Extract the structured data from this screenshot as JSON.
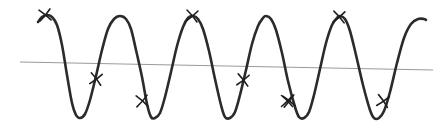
{
  "figure": {
    "background_color": "#ffffff",
    "width": 443,
    "height": 131
  },
  "chart_data": {
    "type": "line",
    "title": "",
    "subtitle": "",
    "xlabel": "",
    "ylabel": "",
    "xlim": [
      0,
      443
    ],
    "ylim": [
      131,
      0
    ],
    "grid": false,
    "legend": null,
    "axis_ticks": {
      "x": [],
      "y": []
    },
    "series": [
      {
        "name": "waveform",
        "kind": "line",
        "color": "#2b2b2b",
        "stroke_width": 2.6,
        "description": "Quasi-sinusoidal oscillation, 5 full peaks, flat-ish rounded crests and troughs, period about 73 px",
        "period_px": 73,
        "peak_y": 16,
        "trough_y": 118,
        "peaks_x": [
          47,
          120,
          193,
          265,
          339
        ],
        "troughs_x": [
          78,
          150,
          226,
          300,
          375
        ],
        "start_point": [
          38,
          22
        ],
        "end_point": [
          426,
          20
        ],
        "points": [
          [
            38,
            22
          ],
          [
            42,
            17
          ],
          [
            47,
            15
          ],
          [
            52,
            17
          ],
          [
            57,
            25
          ],
          [
            62,
            45
          ],
          [
            67,
            75
          ],
          [
            72,
            103
          ],
          [
            76,
            115
          ],
          [
            80,
            118
          ],
          [
            85,
            114
          ],
          [
            90,
            100
          ],
          [
            96,
            76
          ],
          [
            102,
            50
          ],
          [
            108,
            29
          ],
          [
            114,
            19
          ],
          [
            120,
            16
          ],
          [
            126,
            19
          ],
          [
            131,
            29
          ],
          [
            136,
            50
          ],
          [
            142,
            77
          ],
          [
            147,
            104
          ],
          [
            151,
            117
          ],
          [
            155,
            118
          ],
          [
            160,
            113
          ],
          [
            165,
            97
          ],
          [
            171,
            72
          ],
          [
            177,
            46
          ],
          [
            183,
            27
          ],
          [
            188,
            18
          ],
          [
            193,
            16
          ],
          [
            198,
            19
          ],
          [
            203,
            29
          ],
          [
            209,
            51
          ],
          [
            215,
            79
          ],
          [
            221,
            105
          ],
          [
            225,
            117
          ],
          [
            230,
            118
          ],
          [
            235,
            112
          ],
          [
            240,
            95
          ],
          [
            246,
            70
          ],
          [
            252,
            44
          ],
          [
            258,
            26
          ],
          [
            263,
            18
          ],
          [
            266,
            16
          ],
          [
            271,
            19
          ],
          [
            276,
            30
          ],
          [
            282,
            53
          ],
          [
            288,
            81
          ],
          [
            295,
            107
          ],
          [
            299,
            117
          ],
          [
            304,
            118
          ],
          [
            309,
            112
          ],
          [
            314,
            95
          ],
          [
            320,
            69
          ],
          [
            326,
            43
          ],
          [
            332,
            25
          ],
          [
            337,
            18
          ],
          [
            340,
            16
          ],
          [
            345,
            19
          ],
          [
            350,
            31
          ],
          [
            356,
            55
          ],
          [
            363,
            85
          ],
          [
            370,
            110
          ],
          [
            374,
            118
          ],
          [
            379,
            118
          ],
          [
            384,
            111
          ],
          [
            390,
            92
          ],
          [
            397,
            63
          ],
          [
            404,
            38
          ],
          [
            411,
            24
          ],
          [
            418,
            19
          ],
          [
            424,
            19
          ],
          [
            426,
            20
          ]
        ]
      },
      {
        "name": "baseline",
        "kind": "line",
        "color": "#9a9a9a",
        "stroke_width": 1.1,
        "description": "Thin gray near-horizontal reference line sloping slightly downward",
        "points": [
          [
            20,
            62
          ],
          [
            433,
            70
          ]
        ]
      }
    ],
    "annotations": {
      "marker_symbol": "x",
      "marker_color": "#1f1f1f",
      "marker_stroke_width": 1.6,
      "marker_size": 11,
      "count": 9,
      "points": [
        {
          "label": "m1",
          "x": 45,
          "y": 15,
          "location": "peak-1",
          "rotation": -6
        },
        {
          "label": "m2",
          "x": 96,
          "y": 79,
          "location": "rising-edge-1",
          "rotation": 8
        },
        {
          "label": "m3",
          "x": 142,
          "y": 101,
          "location": "falling-edge-2",
          "rotation": -4
        },
        {
          "label": "m4",
          "x": 192,
          "y": 16,
          "location": "peak-3",
          "rotation": 5
        },
        {
          "label": "m5",
          "x": 243,
          "y": 80,
          "location": "rising-edge-3",
          "rotation": 7
        },
        {
          "label": "m6",
          "x": 289,
          "y": 101,
          "location": "falling-edge-4",
          "rotation": -7
        },
        {
          "label": "m7",
          "x": 339,
          "y": 17,
          "location": "peak-5",
          "rotation": 4
        },
        {
          "label": "m8",
          "x": 383,
          "y": 101,
          "location": "falling-edge-5",
          "rotation": 10
        },
        {
          "label": "m9",
          "x": 287,
          "y": 101,
          "location": "duplicate-overlay",
          "rotation": 0
        }
      ]
    }
  }
}
